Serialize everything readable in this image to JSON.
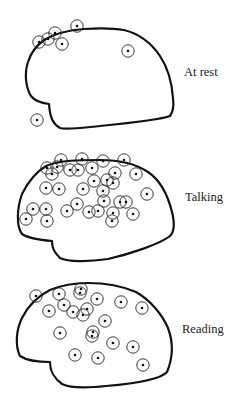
{
  "panels": [
    {
      "label": "At rest",
      "label_pos": [
        184,
        76
      ],
      "outline": "M49,104 C40,103 34,100 31,96 C26,88 24,74 28,62 C31,52 36,46 44,40 C56,33 70,30 84,29 C100,28 112,28 124,30 C140,34 152,44 160,56 C168,68 172,84 173,98 C174,106 173,112 170,116 C160,120 120,124 100,126 C80,128 66,130 60,128 C53,124 50,118 49,104 Z",
      "points": [
        [
          39,
          42
        ],
        [
          48,
          39
        ],
        [
          55,
          33
        ],
        [
          62,
          44
        ],
        [
          77,
          26
        ],
        [
          128,
          51
        ],
        [
          37,
          120
        ]
      ]
    },
    {
      "label": "Talking",
      "label_pos": [
        185,
        201
      ],
      "outline": "M52,241 C40,240 28,238 22,234 C16,226 17,208 22,194 C28,182 36,172 46,166 C60,160 80,160 100,160 C120,160 136,164 148,172 C160,180 168,196 172,212 C175,224 174,232 170,236 C160,244 130,254 108,259 C88,262 68,262 60,258 C54,252 52,248 52,241 Z",
      "points": [
        [
          47,
          168
        ],
        [
          52,
          174
        ],
        [
          57,
          167
        ],
        [
          61,
          160
        ],
        [
          70,
          170
        ],
        [
          78,
          170
        ],
        [
          82,
          159
        ],
        [
          92,
          168
        ],
        [
          103,
          161
        ],
        [
          124,
          160
        ],
        [
          115,
          173
        ],
        [
          136,
          174
        ],
        [
          94,
          181
        ],
        [
          107,
          180
        ],
        [
          113,
          183
        ],
        [
          46,
          188
        ],
        [
          59,
          189
        ],
        [
          83,
          189
        ],
        [
          103,
          191
        ],
        [
          104,
          201
        ],
        [
          147,
          194
        ],
        [
          120,
          202
        ],
        [
          126,
          202
        ],
        [
          33,
          209
        ],
        [
          46,
          209
        ],
        [
          26,
          219
        ],
        [
          47,
          221
        ],
        [
          67,
          211
        ],
        [
          77,
          204
        ],
        [
          89,
          212
        ],
        [
          98,
          211
        ],
        [
          113,
          213
        ],
        [
          112,
          221
        ],
        [
          133,
          214
        ]
      ]
    },
    {
      "label": "Reading",
      "label_pos": [
        182,
        333
      ],
      "outline": "M50,362 C38,362 26,360 20,356 C15,346 16,330 22,318 C28,306 38,296 50,290 C62,285 74,283 88,283 C106,283 122,286 136,292 C150,300 162,314 168,328 C174,344 172,360 167,372 C160,380 130,384 106,386 C88,388 70,388 62,384 C54,378 50,372 50,362 Z",
      "points": [
        [
          36,
          296
        ],
        [
          59,
          294
        ],
        [
          81,
          289
        ],
        [
          80,
          293
        ],
        [
          97,
          299
        ],
        [
          121,
          302
        ],
        [
          142,
          308
        ],
        [
          49,
          311
        ],
        [
          64,
          305
        ],
        [
          73,
          312
        ],
        [
          87,
          309
        ],
        [
          83,
          315
        ],
        [
          105,
          321
        ],
        [
          60,
          333
        ],
        [
          93,
          332
        ],
        [
          92,
          336
        ],
        [
          113,
          343
        ],
        [
          133,
          347
        ],
        [
          75,
          355
        ],
        [
          98,
          358
        ],
        [
          143,
          365
        ]
      ]
    }
  ],
  "marker": {
    "ring_radius": 6.2,
    "dot_radius": 1.3,
    "color": "#111111"
  }
}
